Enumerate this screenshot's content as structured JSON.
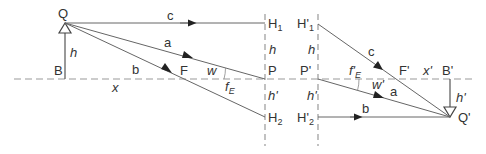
{
  "diagram": {
    "type": "thick-lens-ray-construction",
    "colors": {
      "line": "#555555",
      "dash": "#888888",
      "text": "#333333",
      "background": "#ffffff"
    },
    "object": {
      "top_label": "Q",
      "base_label": "B",
      "height_label": "h",
      "distance_label": "x"
    },
    "image": {
      "top_label": "Q'",
      "base_label": "B'",
      "height_label": "h'",
      "distance_label": "x'"
    },
    "principal_plane_object": {
      "upper_label": "H",
      "upper_sub": "1",
      "axis_label": "P",
      "lower_label": "H",
      "lower_sub": "2",
      "height_label_upper": "h",
      "height_label_lower": "h'"
    },
    "principal_plane_image": {
      "upper_label": "H'",
      "upper_sub": "1",
      "axis_label": "P'",
      "lower_label": "H'",
      "lower_sub": "2",
      "height_label_upper": "h",
      "height_label_lower": "h'"
    },
    "focal_points": {
      "object": "F",
      "image": "F'"
    },
    "focal_lengths": {
      "object": "f",
      "object_sub": "E",
      "image": "f'",
      "image_sub": "E"
    },
    "angles": {
      "object": "w",
      "image": "w'"
    },
    "rays": [
      {
        "id": "a",
        "label": "a"
      },
      {
        "id": "b",
        "label": "b"
      },
      {
        "id": "c",
        "label": "c"
      }
    ]
  }
}
